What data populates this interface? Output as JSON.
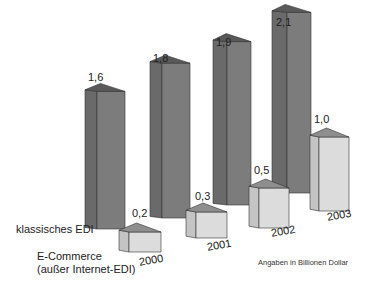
{
  "chart_data": {
    "type": "bar",
    "title": "",
    "xlabel": "",
    "ylabel": "",
    "categories": [
      "2000",
      "2001",
      "2002",
      "2003"
    ],
    "series": [
      {
        "name": "klassisches EDI",
        "values": [
          1.6,
          1.8,
          1.9,
          2.1
        ],
        "labels": [
          "1,6",
          "1,8",
          "1,9",
          "2,1"
        ],
        "color": "#7a7a7a"
      },
      {
        "name": "E-Commerce (außer Internet-EDI)",
        "values": [
          0.2,
          0.3,
          0.5,
          1.0
        ],
        "labels": [
          "0,2",
          "0,3",
          "0,5",
          "1,0"
        ],
        "color": "#d4d4d4"
      }
    ],
    "style": "3d-bar",
    "grid": false,
    "legend_position": "left, inline with series",
    "note": "Angaben in Billionen Dollar"
  },
  "legend": {
    "edi": "klassisches EDI",
    "ecommerce_line1": "E-Commerce",
    "ecommerce_line2": "(außer Internet-EDI)"
  },
  "note": "Angaben in Billionen Dollar",
  "colors": {
    "edi_front": "#7c7c7c",
    "edi_side": "#6a6a6a",
    "edi_top": "#595959",
    "ec_front": "#dcdcdc",
    "ec_side": "#c4c4c4",
    "ec_top": "#8e8e8e"
  }
}
